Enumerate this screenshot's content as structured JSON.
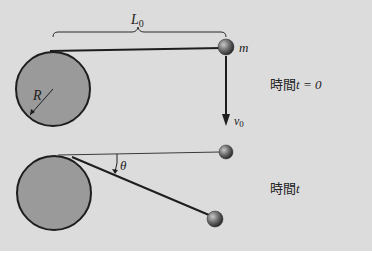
{
  "figure": {
    "labels": {
      "length": "L",
      "length_sub": "0",
      "mass": "m",
      "radius": "R",
      "velocity": "v",
      "velocity_sub": "0",
      "angle": "θ"
    },
    "states": [
      {
        "caption_prefix": "時間",
        "caption_var": "t",
        "caption_suffix": " = 0"
      },
      {
        "caption_prefix": "時間",
        "caption_var": "t",
        "caption_suffix": ""
      }
    ]
  },
  "colors": {
    "background": "#dcdcdc",
    "cylinder_fill": "#9a9a9a",
    "outline": "#1e1e1e",
    "ball": "#6a6a6a"
  }
}
